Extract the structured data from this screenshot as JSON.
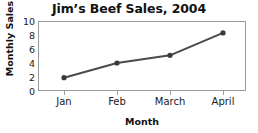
{
  "chart_data": {
    "type": "line",
    "title": "Jim’s Beef Sales, 2004",
    "xlabel": "Month",
    "ylabel": "Monthly Sales",
    "categories": [
      "Jan",
      "Feb",
      "March",
      "April"
    ],
    "values": [
      1.9,
      4.0,
      5.1,
      8.3
    ],
    "series": [
      {
        "name": "Monthly Sales",
        "values": [
          1.9,
          4.0,
          5.1,
          8.3
        ]
      }
    ],
    "ylim": [
      0,
      10
    ],
    "yticks": [
      0,
      2,
      4,
      6,
      8,
      10
    ],
    "ytick_labels": [
      "0",
      "2",
      "4",
      "6",
      "8",
      "10"
    ],
    "grid": false,
    "legend": false,
    "legend_position": "none",
    "colors": {
      "line": "#4a4a4a",
      "marker": "#3a3a3a",
      "axis": "#9a9a9a",
      "text": "#1a1a1a",
      "title": "#111111",
      "background": "#ffffff"
    }
  }
}
